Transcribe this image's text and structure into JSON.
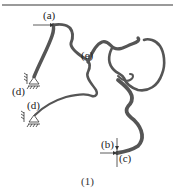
{
  "figure": {
    "caption": "(1)",
    "labels": {
      "a": "(a)",
      "b": "(b)",
      "c": "(c)",
      "d1": "(d)",
      "d2": "(d)",
      "e": "(e)"
    },
    "colors": {
      "structure": "#555555",
      "rule": "#9a9a9a",
      "text": "#222222"
    }
  }
}
